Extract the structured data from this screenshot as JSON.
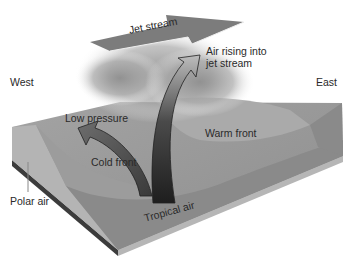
{
  "figure": {
    "labels": {
      "jet_stream": "Jet stream",
      "air_rising_line1": "Air rising into",
      "air_rising_line2": "jet stream",
      "west": "West",
      "east": "East",
      "low_pressure": "Low pressure",
      "warm_front": "Warm front",
      "cold_front": "Cold front",
      "polar_air": "Polar air",
      "tropical_air": "Tropical air"
    },
    "colors": {
      "background": "#ffffff",
      "slab_top": "#9a9a9a",
      "slab_front": "#8a8a8a",
      "slab_side_left": "#b4b4b4",
      "polar_air_region": "#b8b8b8",
      "warm_region": "#a8a8a8",
      "arrow_dark": "#2a2a2a",
      "jet_stream_arrow": "#7c7c7c",
      "cloud": "#9e9e9e",
      "text": "#2a2a2a"
    }
  }
}
